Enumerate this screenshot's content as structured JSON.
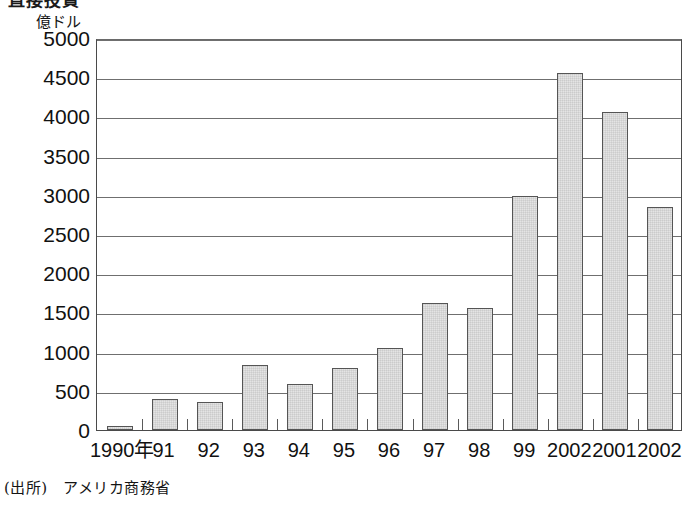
{
  "title": "直接投資",
  "source_note": "(出所)　アメリカ商務省",
  "chart_data": {
    "type": "bar",
    "title": "直接投資",
    "xlabel": "",
    "ylabel": "億ドル",
    "y_unit_label": "億ドル",
    "ylim": [
      0,
      5000
    ],
    "ytick_step": 500,
    "yticks": [
      5000,
      4500,
      4000,
      3500,
      3000,
      2500,
      2000,
      1500,
      1000,
      500,
      0
    ],
    "ytick_labels": [
      "5000",
      "4500",
      "4000",
      "3500",
      "3000",
      "2500",
      "2000",
      "1500",
      "1000",
      "500",
      "0"
    ],
    "categories": [
      "1990年",
      "91",
      "92",
      "93",
      "94",
      "95",
      "96",
      "97",
      "98",
      "99",
      "2002",
      "2001",
      "2002"
    ],
    "values": [
      50,
      400,
      355,
      830,
      590,
      790,
      1040,
      1620,
      1560,
      2985,
      4550,
      4050,
      2850
    ],
    "grid": true,
    "legend": "none",
    "bar_fill_color": "#e4e4e4",
    "bar_edge_color": "#555555",
    "gridline_color": "#6f6f6f",
    "axis_color": "#4a4a4a"
  }
}
